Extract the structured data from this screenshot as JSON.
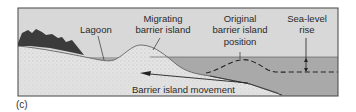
{
  "figure": {
    "panel_label": "(c)",
    "labels": {
      "lagoon": "Lagoon",
      "migrating_line1": "Migrating",
      "migrating_line2": "barrier island",
      "original_line1": "Original",
      "original_line2": "barrier island",
      "original_line3": "position",
      "sealevel_line1": "Sea-level",
      "sealevel_line2": "rise",
      "movement": "Barrier island movement"
    },
    "colors": {
      "sky": "#d9d9d9",
      "water": "#a8a8a8",
      "sand": "#e6e6e6",
      "rock": "#3a3a3a",
      "frame": "#444444"
    }
  }
}
